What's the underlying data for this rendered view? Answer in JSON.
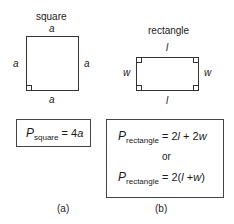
{
  "panels": [
    {
      "id": "a",
      "title": "square",
      "side_labels": {
        "top": "a",
        "left": "a",
        "right": "a",
        "bottom": "a"
      },
      "formula": {
        "symbol": "P",
        "subscript": "square",
        "rhs": "= 4",
        "rhs_var": "a"
      },
      "caption": "(a)"
    },
    {
      "id": "b",
      "title": "rectangle",
      "side_labels": {
        "top": "l",
        "left": "w",
        "right": "w",
        "bottom": "l"
      },
      "formulas": [
        {
          "symbol": "P",
          "subscript": "rectangle",
          "rhs_parts": [
            "= 2",
            "l",
            " + 2",
            "w"
          ]
        },
        {
          "connector": "or"
        },
        {
          "symbol": "P",
          "subscript": "rectangle",
          "rhs_parts": [
            "= 2(",
            "l",
            " +",
            "w",
            ")"
          ]
        }
      ],
      "caption": "(b)"
    }
  ]
}
